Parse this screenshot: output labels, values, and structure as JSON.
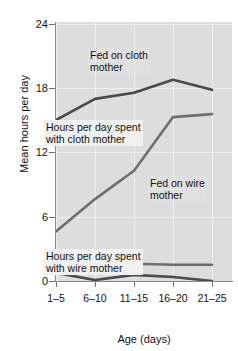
{
  "chart_data": {
    "type": "line",
    "title": "",
    "xlabel": "Age (days)",
    "ylabel": "Mean hours per day",
    "categories": [
      "1–5",
      "6–10",
      "11–15",
      "16–20",
      "21–25"
    ],
    "xticklabels": [
      "1–5",
      "6–10",
      "11–15",
      "16–20",
      "21–25"
    ],
    "yticklabels": [
      "0",
      "6",
      "12",
      "18",
      "24"
    ],
    "yticks": [
      0,
      6,
      12,
      18,
      24
    ],
    "ylim": [
      0,
      25.6
    ],
    "grid": true,
    "legend": "none (series labeled by in-plot annotations)",
    "series": [
      {
        "name": "Fed on cloth mother",
        "color": "#4a4a4a",
        "values": [
          15.9,
          18.0,
          18.6,
          19.9,
          18.9
        ]
      },
      {
        "name": "Fed on wire mother",
        "color": "#6e6e6e",
        "values": [
          4.9,
          8.1,
          10.9,
          16.2,
          16.5
        ]
      },
      {
        "name": "Hours per day spent with cloth mother",
        "color": "#6e6e6e",
        "values": [
          1.8,
          1.1,
          1.7,
          1.6,
          1.6
        ]
      },
      {
        "name": "Hours per day spent with wire mother",
        "color": "#4a4a4a",
        "values": [
          0.8,
          0.1,
          0.6,
          0.4,
          0.0
        ]
      }
    ],
    "annotations": [
      {
        "id": "fed-cloth",
        "line1": "Fed on cloth",
        "line2": "mother"
      },
      {
        "id": "spent-cloth",
        "line1": "Hours per day spent",
        "line2": "with cloth mother"
      },
      {
        "id": "fed-wire",
        "line1": "Fed on wire",
        "line2": "mother"
      },
      {
        "id": "spent-wire",
        "line1": "Hours per day spent",
        "line2": "with wire mother"
      }
    ],
    "colors": {
      "plot_background": "#dddddd",
      "figure_background": "#ffffff",
      "gridline": "#efefef",
      "axis": "#8a8a8a",
      "dark_series": "#4a4a4a",
      "light_series": "#6e6e6e",
      "annotation_box": "#f0f0f0"
    }
  }
}
